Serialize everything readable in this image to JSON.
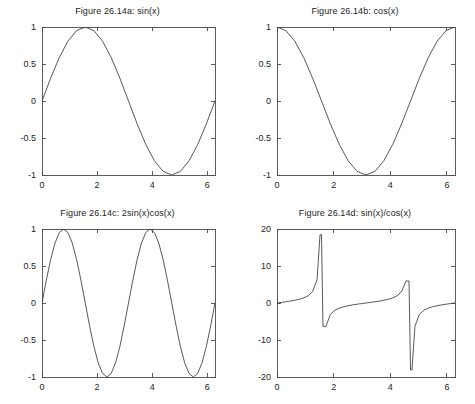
{
  "figure": {
    "background": "#ffffff",
    "line_color": "#3a3a3a",
    "axis_color": "#4a4a4a",
    "rows": 2,
    "cols": 2
  },
  "panels": [
    {
      "id": "panel-a",
      "title": "Figure 26.14a: sin(x)",
      "chart_data": {
        "type": "line",
        "title": "Figure 26.14a: sin(x)",
        "expression": "sin(x)",
        "xlabel": "",
        "ylabel": "",
        "xlim": [
          0,
          6.2832
        ],
        "ylim": [
          -1,
          1
        ],
        "xticks": [
          0,
          2,
          4,
          6
        ],
        "xtick_labels": [
          "0",
          "2",
          "4",
          "6"
        ],
        "yticks": [
          -1,
          -0.5,
          0,
          0.5,
          1
        ],
        "ytick_labels": [
          "-1",
          "-0.5",
          "0",
          "0.5",
          "1"
        ],
        "grid": false,
        "legend": false,
        "series": [
          {
            "name": "sin(x)",
            "x": [
              0,
              0.3142,
              0.6283,
              0.9425,
              1.2566,
              1.5708,
              1.885,
              2.1991,
              2.5133,
              2.8274,
              3.1416,
              3.4558,
              3.7699,
              4.0841,
              4.3982,
              4.7124,
              5.0265,
              5.3407,
              5.6549,
              5.969,
              6.2832
            ],
            "y": [
              0,
              0.309,
              0.5878,
              0.809,
              0.9511,
              1,
              0.9511,
              0.809,
              0.5878,
              0.309,
              0,
              -0.309,
              -0.5878,
              -0.809,
              -0.9511,
              -1,
              -0.9511,
              -0.809,
              -0.5878,
              -0.309,
              0
            ]
          }
        ]
      }
    },
    {
      "id": "panel-b",
      "title": "Figure 26.14b: cos(x)",
      "chart_data": {
        "type": "line",
        "title": "Figure 26.14b: cos(x)",
        "expression": "cos(x)",
        "xlabel": "",
        "ylabel": "",
        "xlim": [
          0,
          6.2832
        ],
        "ylim": [
          -1,
          1
        ],
        "xticks": [
          0,
          2,
          4,
          6
        ],
        "xtick_labels": [
          "0",
          "2",
          "4",
          "6"
        ],
        "yticks": [
          -1,
          -0.5,
          0,
          0.5,
          1
        ],
        "ytick_labels": [
          "-1",
          "-0.5",
          "0",
          "0.5",
          "1"
        ],
        "grid": false,
        "legend": false,
        "series": [
          {
            "name": "cos(x)",
            "x": [
              0,
              0.3142,
              0.6283,
              0.9425,
              1.2566,
              1.5708,
              1.885,
              2.1991,
              2.5133,
              2.8274,
              3.1416,
              3.4558,
              3.7699,
              4.0841,
              4.3982,
              4.7124,
              5.0265,
              5.3407,
              5.6549,
              5.969,
              6.2832
            ],
            "y": [
              1,
              0.9511,
              0.809,
              0.5878,
              0.309,
              0,
              -0.309,
              -0.5878,
              -0.809,
              -0.9511,
              -1,
              -0.9511,
              -0.809,
              -0.5878,
              -0.309,
              0,
              0.309,
              0.5878,
              0.809,
              0.9511,
              1
            ]
          }
        ]
      }
    },
    {
      "id": "panel-c",
      "title": "Figure 26.14c: 2sin(x)cos(x)",
      "chart_data": {
        "type": "line",
        "title": "Figure 26.14c: 2sin(x)cos(x)",
        "expression": "2sin(x)cos(x)",
        "xlabel": "",
        "ylabel": "",
        "xlim": [
          0,
          6.2832
        ],
        "ylim": [
          -1,
          1
        ],
        "xticks": [
          0,
          2,
          4,
          6
        ],
        "xtick_labels": [
          "0",
          "2",
          "4",
          "6"
        ],
        "yticks": [
          -1,
          -0.5,
          0,
          0.5,
          1
        ],
        "ytick_labels": [
          "-1",
          "-0.5",
          "0",
          "0.5",
          "1"
        ],
        "grid": false,
        "legend": false,
        "series": [
          {
            "name": "2sin(x)cos(x)",
            "x": [
              0,
              0.1571,
              0.3142,
              0.4712,
              0.6283,
              0.7854,
              0.9425,
              1.0996,
              1.2566,
              1.4137,
              1.5708,
              1.7279,
              1.885,
              2.042,
              2.1991,
              2.3562,
              2.5133,
              2.6704,
              2.8274,
              2.9845,
              3.1416,
              3.2987,
              3.4558,
              3.6128,
              3.7699,
              3.927,
              4.0841,
              4.2412,
              4.3982,
              4.5553,
              4.7124,
              4.8695,
              5.0265,
              5.1836,
              5.3407,
              5.4978,
              5.6549,
              5.8119,
              5.969,
              6.1261,
              6.2832
            ],
            "y": [
              0,
              0.309,
              0.5878,
              0.809,
              0.9511,
              1,
              0.9511,
              0.809,
              0.5878,
              0.309,
              0,
              -0.309,
              -0.5878,
              -0.809,
              -0.9511,
              -1,
              -0.9511,
              -0.809,
              -0.5878,
              -0.309,
              0,
              0.309,
              0.5878,
              0.809,
              0.9511,
              1,
              0.9511,
              0.809,
              0.5878,
              0.309,
              0,
              -0.309,
              -0.5878,
              -0.809,
              -0.9511,
              -1,
              -0.9511,
              -0.809,
              -0.5878,
              -0.309,
              0
            ]
          }
        ]
      }
    },
    {
      "id": "panel-d",
      "title": "Figure 26.14d: sin(x)/cos(x)",
      "chart_data": {
        "type": "line",
        "title": "Figure 26.14d: sin(x)/cos(x)",
        "expression": "sin(x)/cos(x)",
        "xlabel": "",
        "ylabel": "",
        "xlim": [
          0,
          6.2832
        ],
        "ylim": [
          -20,
          20
        ],
        "xticks": [
          0,
          2,
          4,
          6
        ],
        "xtick_labels": [
          "0",
          "2",
          "4",
          "6"
        ],
        "yticks": [
          -20,
          -10,
          0,
          10,
          20
        ],
        "ytick_labels": [
          "-20",
          "-10",
          "0",
          "10",
          "20"
        ],
        "grid": false,
        "legend": false,
        "series": [
          {
            "name": "tan(x)",
            "x": [
              0,
              0.1571,
              0.3142,
              0.4712,
              0.6283,
              0.7854,
              0.9425,
              1.0996,
              1.2566,
              1.4137,
              1.5184,
              1.5708,
              1.6232,
              1.7279,
              1.885,
              2.042,
              2.1991,
              2.3562,
              2.5133,
              2.6704,
              2.8274,
              2.9845,
              3.1416,
              3.2987,
              3.4558,
              3.6128,
              3.7699,
              3.927,
              4.0841,
              4.2412,
              4.3982,
              4.5553,
              4.6601,
              4.7124,
              4.7648,
              4.8695,
              5.0265,
              5.1836,
              5.3407,
              5.4978,
              5.6549,
              5.8119,
              5.969,
              6.1261,
              6.2832
            ],
            "y": [
              0,
              0.1584,
              0.3249,
              0.5095,
              0.7265,
              1,
              1.3764,
              1.9626,
              3.0777,
              6.3138,
              18.46,
              18.46,
              -6.31,
              -6.31,
              -3.0777,
              -1.9626,
              -1.3764,
              -1,
              -0.7265,
              -0.5095,
              -0.3249,
              -0.1584,
              0,
              0.1584,
              0.3249,
              0.5095,
              0.7265,
              1,
              1.3764,
              1.9626,
              3.0777,
              5.95,
              5.95,
              -18.1,
              -18.1,
              -6.31,
              -3.0777,
              -1.9626,
              -1.3764,
              -1,
              -0.7265,
              -0.5095,
              -0.3249,
              -0.1584,
              0
            ]
          }
        ]
      }
    }
  ]
}
